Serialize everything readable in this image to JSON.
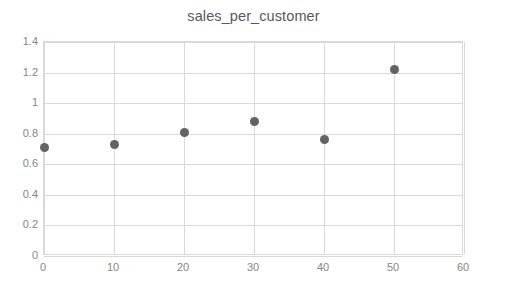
{
  "chart_data": {
    "type": "scatter",
    "title": "sales_per_customer",
    "xlabel": "",
    "ylabel": "",
    "x": [
      0,
      10,
      20,
      30,
      40,
      50
    ],
    "values": [
      0.71,
      0.73,
      0.81,
      0.88,
      0.76,
      1.22
    ],
    "series": [
      {
        "name": "sales_per_customer",
        "x": [
          0,
          10,
          20,
          30,
          40,
          50
        ],
        "values": [
          0.71,
          0.73,
          0.81,
          0.88,
          0.76,
          1.22
        ]
      }
    ],
    "xlim": [
      0,
      60
    ],
    "ylim": [
      0,
      1.4
    ],
    "xticks": [
      "0",
      "10",
      "20",
      "30",
      "40",
      "50",
      "60"
    ],
    "xtick_values": [
      0,
      10,
      20,
      30,
      40,
      50,
      60
    ],
    "yticks": [
      "0",
      "0.2",
      "0.4",
      "0.6",
      "0.8",
      "1",
      "1.2",
      "1.4"
    ],
    "ytick_values": [
      0,
      0.2,
      0.4,
      0.6,
      0.8,
      1,
      1.2,
      1.4
    ],
    "grid": true,
    "grid_axis": "both",
    "legend": false,
    "legend_position": "none",
    "marker_color": "#636363",
    "grid_color": "#d9d9d9",
    "axis_label_color": "#868686",
    "title_color": "#595959",
    "background_color": "#ffffff"
  }
}
